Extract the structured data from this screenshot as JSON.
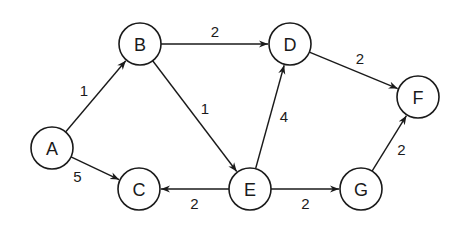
{
  "graph": {
    "type": "directed-weighted-graph",
    "nodes": [
      {
        "id": "A",
        "label": "A"
      },
      {
        "id": "B",
        "label": "B"
      },
      {
        "id": "C",
        "label": "C"
      },
      {
        "id": "D",
        "label": "D"
      },
      {
        "id": "E",
        "label": "E"
      },
      {
        "id": "F",
        "label": "F"
      },
      {
        "id": "G",
        "label": "G"
      }
    ],
    "edges": [
      {
        "from": "A",
        "to": "B",
        "weight": "1"
      },
      {
        "from": "A",
        "to": "C",
        "weight": "5"
      },
      {
        "from": "B",
        "to": "D",
        "weight": "2"
      },
      {
        "from": "B",
        "to": "E",
        "weight": "1"
      },
      {
        "from": "E",
        "to": "D",
        "weight": "4"
      },
      {
        "from": "D",
        "to": "F",
        "weight": "2"
      },
      {
        "from": "E",
        "to": "C",
        "weight": "2"
      },
      {
        "from": "E",
        "to": "G",
        "weight": "2"
      },
      {
        "from": "G",
        "to": "F",
        "weight": "2"
      }
    ]
  }
}
